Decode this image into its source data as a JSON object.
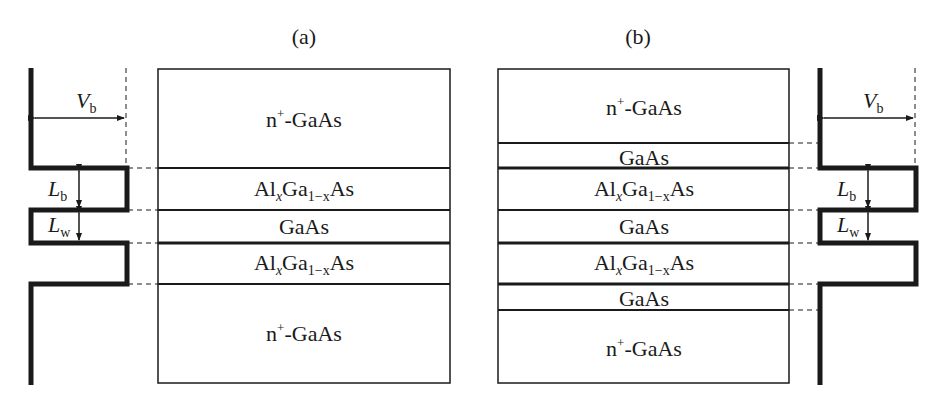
{
  "panels": [
    {
      "id": "a",
      "label": "(a)",
      "layers": [
        {
          "name": "n+-GaAs",
          "base": "n",
          "sup": "+",
          "rest": "-GaAs",
          "y0": 69,
          "y1": 168
        },
        {
          "name": "AlxGa1-xAs",
          "y0": 168,
          "y1": 210
        },
        {
          "name": "GaAs",
          "text": "GaAs",
          "y0": 210,
          "y1": 243
        },
        {
          "name": "AlxGa1-xAs",
          "y0": 243,
          "y1": 284
        },
        {
          "name": "n+-GaAs",
          "base": "n",
          "sup": "+",
          "rest": "-GaAs",
          "y0": 284,
          "y1": 383
        }
      ],
      "potential_labels": {
        "barrier_height": "V",
        "barrier_height_sub": "b",
        "barrier_width": "L",
        "barrier_width_sub": "b",
        "well_width": "L",
        "well_width_sub": "w"
      }
    },
    {
      "id": "b",
      "label": "(b)",
      "layers": [
        {
          "name": "n+-GaAs",
          "base": "n",
          "sup": "+",
          "rest": "-GaAs",
          "y0": 69,
          "y1": 143
        },
        {
          "name": "GaAs spacer",
          "text": "GaAs",
          "y0": 143,
          "y1": 168
        },
        {
          "name": "AlxGa1-xAs",
          "y0": 168,
          "y1": 210
        },
        {
          "name": "GaAs",
          "text": "GaAs",
          "y0": 210,
          "y1": 243
        },
        {
          "name": "AlxGa1-xAs",
          "y0": 243,
          "y1": 284
        },
        {
          "name": "GaAs spacer",
          "text": "GaAs",
          "y0": 284,
          "y1": 310
        },
        {
          "name": "n+-GaAs",
          "base": "n",
          "sup": "+",
          "rest": "-GaAs",
          "y0": 310,
          "y1": 383
        }
      ],
      "potential_labels": {
        "barrier_height": "V",
        "barrier_height_sub": "b",
        "barrier_width": "L",
        "barrier_width_sub": "b",
        "well_width": "L",
        "well_width_sub": "w"
      }
    }
  ],
  "text": {
    "panel_a": "(a)",
    "panel_b": "(b)",
    "n_plus_gaas_n": "n",
    "n_plus_gaas_sup": "+",
    "n_plus_gaas_rest": "-GaAs",
    "gaas": "GaAs",
    "algaas_al": "Al",
    "algaas_x": "x",
    "algaas_ga": "Ga",
    "algaas_sub": "1−x",
    "algaas_as": "As",
    "vb_main": "V",
    "vb_sub": "b",
    "lb_main": "L",
    "lb_sub": "b",
    "lw_main": "L",
    "lw_sub": "w"
  },
  "colors": {
    "line": "#1a1a1a",
    "background": "#ffffff"
  }
}
